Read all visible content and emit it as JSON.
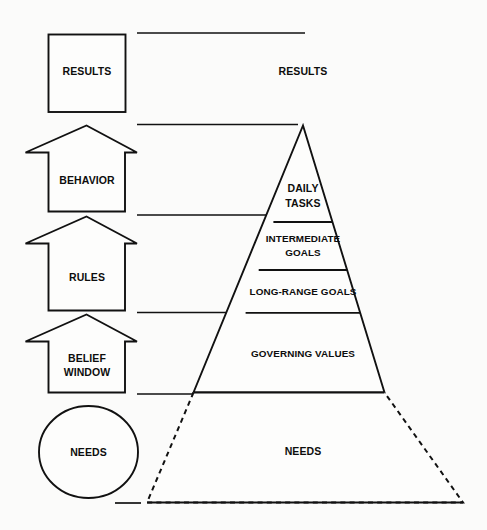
{
  "diagram": {
    "background_color": "#fbfbfa",
    "line_color": "#111111",
    "text_color": "#0d0d0d",
    "left_column": {
      "name": "process-chain",
      "items": [
        {
          "id": "results",
          "shape": "square",
          "label": "RESULTS"
        },
        {
          "id": "behavior",
          "shape": "up-arrow",
          "label": "BEHAVIOR"
        },
        {
          "id": "rules",
          "shape": "up-arrow",
          "label": "RULES"
        },
        {
          "id": "belief-window",
          "shape": "up-arrow",
          "label_line1": "BELIEF",
          "label_line2": "WINDOW"
        },
        {
          "id": "needs",
          "shape": "circle",
          "label": "NEEDS"
        }
      ]
    },
    "right_column": {
      "name": "results-pyramid",
      "top_label": "RESULTS",
      "tiers": [
        {
          "id": "daily-tasks",
          "label_line1": "DAILY",
          "label_line2": "TASKS"
        },
        {
          "id": "intermediate-goals",
          "label_line1": "INTERMEDIATE",
          "label_line2": "GOALS"
        },
        {
          "id": "long-range-goals",
          "label": "LONG-RANGE GOALS"
        },
        {
          "id": "governing-values",
          "label": "GOVERNING VALUES"
        },
        {
          "id": "needs",
          "label": "NEEDS",
          "border_style": "dashed"
        }
      ]
    },
    "connector_lines": {
      "name": "tier-connector-lines",
      "count": 6
    }
  }
}
